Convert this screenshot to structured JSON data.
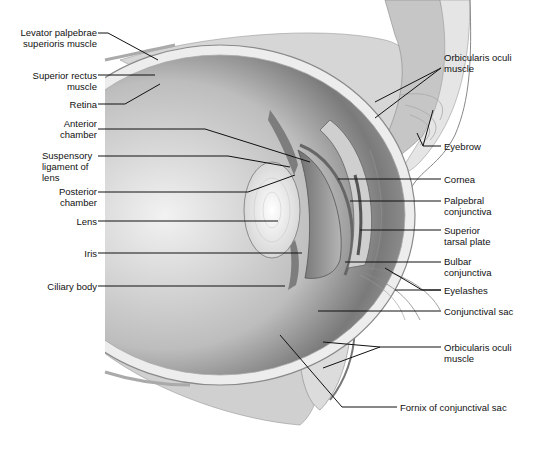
{
  "diagram": {
    "labels_left": [
      {
        "id": "levator",
        "text": "Levator palpebrae\nsuperioris muscle"
      },
      {
        "id": "superior-rectus",
        "text": "Superior rectus\nmuscle"
      },
      {
        "id": "retina",
        "text": "Retina"
      },
      {
        "id": "anterior-chamber",
        "text": "Anterior\nchamber"
      },
      {
        "id": "suspensory-ligament",
        "text": "Suspensory\nligament of\nlens"
      },
      {
        "id": "posterior-chamber",
        "text": "Posterior\nchamber"
      },
      {
        "id": "lens",
        "text": "Lens"
      },
      {
        "id": "iris",
        "text": "Iris"
      },
      {
        "id": "ciliary-body",
        "text": "Ciliary body"
      }
    ],
    "labels_right": [
      {
        "id": "orbicularis-upper",
        "text": "Orbicularis oculi\nmuscle"
      },
      {
        "id": "eyebrow",
        "text": "Eyebrow"
      },
      {
        "id": "cornea",
        "text": "Cornea"
      },
      {
        "id": "palpebral-conjunctiva",
        "text": "Palpebral\nconjunctiva"
      },
      {
        "id": "superior-tarsal-plate",
        "text": "Superior\ntarsal plate"
      },
      {
        "id": "bulbar-conjunctiva",
        "text": "Bulbar\nconjunctiva"
      },
      {
        "id": "eyelashes",
        "text": "Eyelashes"
      },
      {
        "id": "conjunctival-sac",
        "text": "Conjunctival sac"
      },
      {
        "id": "orbicularis-lower",
        "text": "Orbicularis oculi\nmuscle"
      },
      {
        "id": "fornix",
        "text": "Fornix of conjunctival sac"
      }
    ]
  }
}
